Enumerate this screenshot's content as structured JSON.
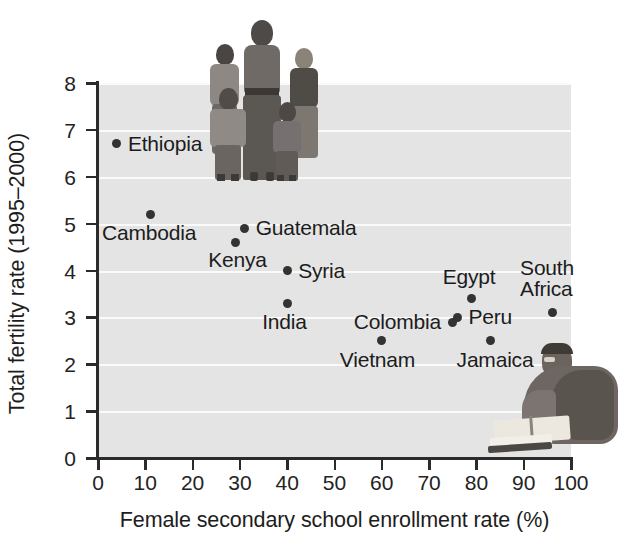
{
  "chart_data": {
    "type": "scatter",
    "title": "",
    "xlabel": "Female secondary school enrollment rate (%)",
    "ylabel": "Total fertility rate (1995–2000)",
    "xlim": [
      0,
      100
    ],
    "ylim": [
      0,
      8
    ],
    "xticks": [
      0,
      10,
      20,
      30,
      40,
      50,
      60,
      70,
      80,
      90,
      100
    ],
    "yticks": [
      0,
      1,
      2,
      3,
      4,
      5,
      6,
      7,
      8
    ],
    "grid": "horizontal-white-gridlines",
    "legend": "none",
    "plot_background": "#e4e4e4",
    "point_color": "#333333",
    "points": [
      {
        "label": "Ethiopia",
        "x": 4,
        "y": 6.7,
        "label_dx": 11,
        "label_dy": -11,
        "label_align": "left"
      },
      {
        "label": "Cambodia",
        "x": 11,
        "y": 5.2,
        "label_dx": -48,
        "label_dy": 8,
        "label_align": "left"
      },
      {
        "label": "Guatemala",
        "x": 31,
        "y": 4.9,
        "label_dx": 11,
        "label_dy": -11,
        "label_align": "left"
      },
      {
        "label": "Kenya",
        "x": 29,
        "y": 4.6,
        "label_dx": -27,
        "label_dy": 7,
        "label_align": "left"
      },
      {
        "label": "Syria",
        "x": 40,
        "y": 4.0,
        "label_dx": 11,
        "label_dy": -11,
        "label_align": "left"
      },
      {
        "label": "India",
        "x": 40,
        "y": 3.3,
        "label_dx": -25,
        "label_dy": 8,
        "label_align": "left"
      },
      {
        "label": "Egypt",
        "x": 79,
        "y": 3.4,
        "label_dx": -29,
        "label_dy": -33,
        "label_align": "left"
      },
      {
        "label": "South\nAfrica",
        "x": 96,
        "y": 3.1,
        "label_dx": -32,
        "label_dy": -56,
        "label_align": "left"
      },
      {
        "label": "Peru",
        "x": 76,
        "y": 3.0,
        "label_dx": 11,
        "label_dy": -11,
        "label_align": "left"
      },
      {
        "label": "Colombia",
        "x": 75,
        "y": 2.9,
        "label_dx": -99,
        "label_dy": -11,
        "label_align": "left"
      },
      {
        "label": "Jamaica",
        "x": 83,
        "y": 2.5,
        "label_dx": -34,
        "label_dy": 8,
        "label_align": "left"
      },
      {
        "label": "Vietnam",
        "x": 60,
        "y": 2.5,
        "label_dx": -42,
        "label_dy": 8,
        "label_align": "left"
      }
    ]
  },
  "images": {
    "family_photo_caption": "family-group-photo",
    "reading_photo_caption": "woman-reading-book-photo"
  }
}
